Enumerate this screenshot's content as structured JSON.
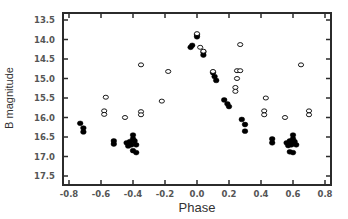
{
  "chart_data": {
    "type": "scatter",
    "title": "",
    "xlabel": "Phase",
    "ylabel": "B magnitude",
    "xlim": [
      -0.82,
      0.82
    ],
    "ylim": [
      17.7,
      13.4
    ],
    "y_inverted": true,
    "grid": false,
    "legend": null,
    "x_ticks": [
      -0.8,
      -0.6,
      -0.4,
      -0.2,
      0.0,
      0.2,
      0.4,
      0.6,
      0.8
    ],
    "x_tick_labels": [
      "-0.8",
      "-0.6",
      "-0.4",
      "-0.2",
      "0.0",
      "0.2",
      "0.4",
      "0.6",
      "0.8"
    ],
    "y_ticks": [
      13.5,
      14.0,
      14.5,
      15.0,
      15.5,
      16.0,
      16.5,
      17.0,
      17.5
    ],
    "y_tick_labels": [
      "13.5",
      "14.0",
      "14.5",
      "15.0",
      "15.5",
      "16.0",
      "16.5",
      "17.0",
      "17.5"
    ],
    "series": [
      {
        "name": "filled",
        "marker": "filled-circle",
        "color": "#000000",
        "points": [
          [
            -0.73,
            16.15
          ],
          [
            -0.71,
            16.27
          ],
          [
            -0.71,
            16.37
          ],
          [
            -0.52,
            16.6
          ],
          [
            -0.52,
            16.68
          ],
          [
            -0.44,
            16.65
          ],
          [
            -0.43,
            16.73
          ],
          [
            -0.42,
            16.62
          ],
          [
            -0.41,
            16.7
          ],
          [
            -0.4,
            16.45
          ],
          [
            -0.4,
            16.55
          ],
          [
            -0.39,
            16.6
          ],
          [
            -0.38,
            16.7
          ],
          [
            -0.4,
            16.85
          ],
          [
            -0.38,
            16.9
          ],
          [
            -0.03,
            14.15
          ],
          [
            -0.04,
            14.2
          ],
          [
            0.0,
            13.88
          ],
          [
            0.0,
            13.93
          ],
          [
            0.04,
            14.32
          ],
          [
            0.04,
            14.4
          ],
          [
            0.1,
            14.85
          ],
          [
            0.11,
            14.95
          ],
          [
            0.12,
            15.05
          ],
          [
            0.17,
            15.55
          ],
          [
            0.19,
            15.65
          ],
          [
            0.2,
            15.72
          ],
          [
            0.28,
            16.05
          ],
          [
            0.3,
            16.18
          ],
          [
            0.3,
            16.35
          ],
          [
            0.47,
            16.55
          ],
          [
            0.47,
            16.65
          ],
          [
            0.56,
            16.65
          ],
          [
            0.57,
            16.72
          ],
          [
            0.58,
            16.6
          ],
          [
            0.59,
            16.7
          ],
          [
            0.6,
            16.45
          ],
          [
            0.6,
            16.55
          ],
          [
            0.61,
            16.62
          ],
          [
            0.62,
            16.7
          ],
          [
            0.58,
            16.88
          ],
          [
            0.6,
            16.9
          ]
        ]
      },
      {
        "name": "open",
        "marker": "open-circle",
        "color": "#000000",
        "points": [
          [
            -0.57,
            15.48
          ],
          [
            -0.58,
            15.83
          ],
          [
            -0.58,
            15.92
          ],
          [
            -0.45,
            16.0
          ],
          [
            -0.35,
            14.65
          ],
          [
            -0.35,
            15.85
          ],
          [
            -0.35,
            15.93
          ],
          [
            -0.22,
            15.58
          ],
          [
            -0.18,
            14.82
          ],
          [
            0.0,
            13.85
          ],
          [
            0.02,
            14.2
          ],
          [
            0.04,
            14.3
          ],
          [
            0.1,
            14.82
          ],
          [
            0.25,
            14.8
          ],
          [
            0.27,
            14.8
          ],
          [
            0.25,
            15.0
          ],
          [
            0.24,
            15.23
          ],
          [
            0.24,
            15.33
          ],
          [
            0.27,
            14.13
          ],
          [
            0.43,
            15.5
          ],
          [
            0.42,
            15.83
          ],
          [
            0.42,
            15.93
          ],
          [
            0.55,
            16.0
          ],
          [
            0.65,
            14.65
          ],
          [
            0.7,
            15.83
          ],
          [
            0.7,
            15.93
          ]
        ]
      }
    ]
  }
}
